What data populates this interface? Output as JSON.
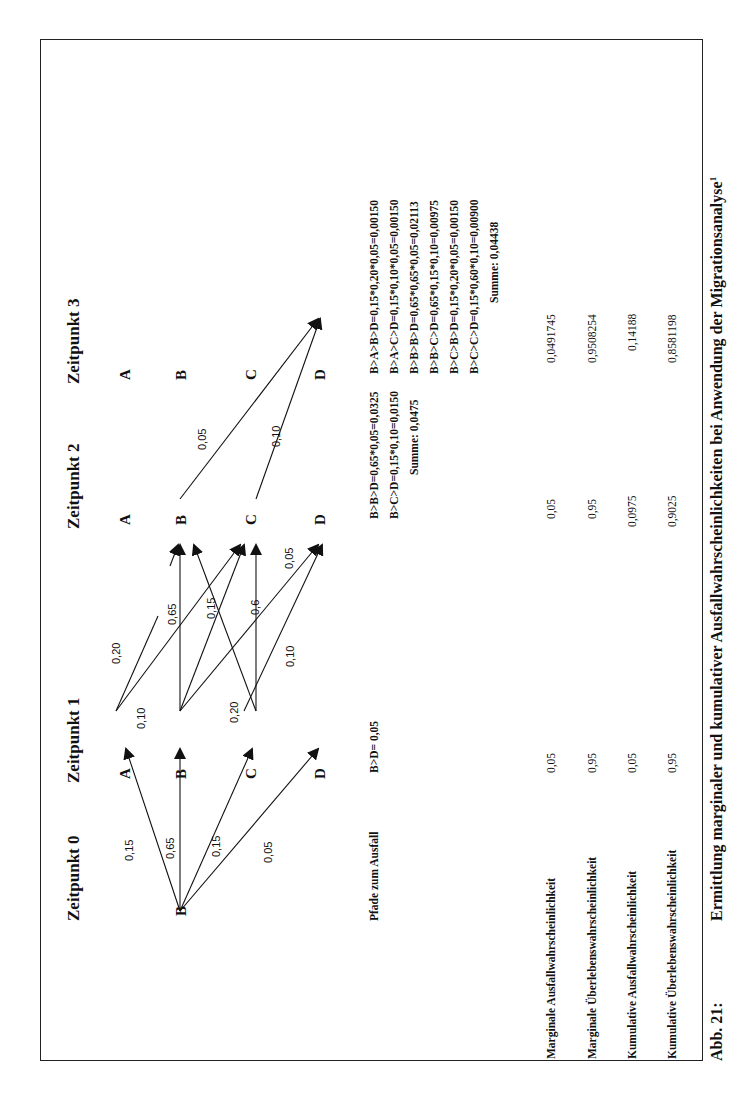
{
  "figure": {
    "caption_number": "Abb. 21:",
    "caption_title": "Ermittlung marginaler und kumulativer Ausfallwahrscheinlichkeiten bei Anwendung der Migrationsanalyse",
    "caption_footnote": "1"
  },
  "timepoints": [
    {
      "label": "Zeitpunkt 0",
      "nodes": [
        "B"
      ]
    },
    {
      "label": "Zeitpunkt 1",
      "nodes": [
        "A",
        "B",
        "C",
        "D"
      ]
    },
    {
      "label": "Zeitpunkt 2",
      "nodes": [
        "A",
        "B",
        "C",
        "D"
      ]
    },
    {
      "label": "Zeitpunkt 3",
      "nodes": [
        "A",
        "B",
        "C",
        "D"
      ]
    }
  ],
  "edges": {
    "t0_t1": [
      {
        "from": "B",
        "to": "A",
        "p": "0,15"
      },
      {
        "from": "B",
        "to": "B",
        "p": "0,65"
      },
      {
        "from": "B",
        "to": "C",
        "p": "0,15"
      },
      {
        "from": "B",
        "to": "D",
        "p": "0,05"
      }
    ],
    "t1_t2": [
      {
        "from": "A",
        "to": "B",
        "p": "0,20"
      },
      {
        "from": "A",
        "to": "C",
        "p": "0,10"
      },
      {
        "from": "B",
        "to": "B",
        "p": "0,65"
      },
      {
        "from": "B",
        "to": "C",
        "p": "0,15"
      },
      {
        "from": "B",
        "to": "D",
        "p": "0,05"
      },
      {
        "from": "C",
        "to": "B",
        "p": "0,20"
      },
      {
        "from": "C",
        "to": "C",
        "p": "0,6"
      },
      {
        "from": "C",
        "to": "D",
        "p": "0,10"
      }
    ],
    "t2_t3": [
      {
        "from": "B",
        "to": "D",
        "p": "0,05"
      },
      {
        "from": "C",
        "to": "D",
        "p": "0,10"
      }
    ]
  },
  "paths": {
    "row_label": "Pfade zum Ausfall",
    "t1": [
      "B>D= 0,05"
    ],
    "t2": [
      "B>B>D=0,65*0,05=0,0325",
      "B>C>D=0,15*0,10=0,0150"
    ],
    "t2_sum": "Summe: 0,0475",
    "t3": [
      "B>A>B>D=0,15*0,20*0,05=0,00150",
      "B>A>C>D=0,15*0,10*0,05=0,00150",
      "B>B>B>D=0,65*0,65*0,05=0,02113",
      "B>B>C>D=0,65*0,15*0,10=0,00975",
      "B>C>B>D=0,15*0,20*0,05=0,00150",
      "B>C>C>D=0,15*0,60*0,10=0,00900"
    ],
    "t3_sum": "Summe: 0,04438"
  },
  "metrics": [
    {
      "label": "Marginale Ausfallwahrscheinlichkeit",
      "t1": "0,05",
      "t2": "0,05",
      "t3": "0,0491745"
    },
    {
      "label": "Marginale Überlebenswahrscheinlichkeit",
      "t1": "0,95",
      "t2": "0,95",
      "t3": "0,9508254"
    },
    {
      "label": "Kumulative Ausfallwahrscheinlichkeit",
      "t1": "0,05",
      "t2": "0,0975",
      "t3": "0,14188"
    },
    {
      "label": "Kumulative Überlebenswahrscheinlichkeit",
      "t1": "0,95",
      "t2": "0,9025",
      "t3": "0,8581198"
    }
  ]
}
